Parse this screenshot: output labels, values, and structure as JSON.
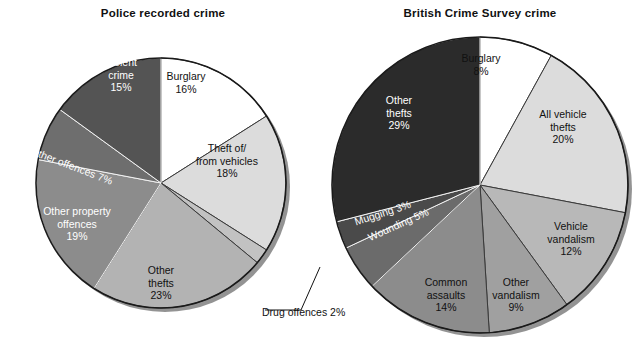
{
  "figure": {
    "background": "#ffffff",
    "left_title": "Police recorded crime",
    "right_title": "British Crime Survey crime"
  },
  "chart_data": [
    {
      "type": "pie",
      "title": "Police recorded crime",
      "xlabel": "",
      "ylabel": "",
      "units": "percent",
      "start_angle_deg": 0,
      "direction": "clockwise",
      "legend": "none (slices labelled in place)",
      "categories": [
        "Burglary",
        "Theft of/from vehicles",
        "Drug offences",
        "Other thefts",
        "Other property offences",
        "All other offences",
        "Violent crime"
      ],
      "values": [
        16,
        18,
        2,
        23,
        19,
        7,
        15
      ],
      "slices": [
        {
          "label": "Burglary",
          "label_line1": "Burglary",
          "label_line2": "16%",
          "value": 16,
          "pct": "16%",
          "color": "#ffffff",
          "text_color": "dark"
        },
        {
          "label": "Theft of/from vehicles",
          "label_line1": "Theft of/",
          "label_line2": "from vehicles",
          "label_line3": "18%",
          "value": 18,
          "pct": "18%",
          "color": "#dcdcdc",
          "text_color": "dark"
        },
        {
          "label": "Drug offences",
          "label_line1": "Drug offences 2%",
          "value": 2,
          "pct": "2%",
          "color": "#c2c2c2",
          "text_color": "dark",
          "callout": true
        },
        {
          "label": "Other thefts",
          "label_line1": "Other",
          "label_line2": "thefts",
          "label_line3": "23%",
          "value": 23,
          "pct": "23%",
          "color": "#b3b3b3",
          "text_color": "dark"
        },
        {
          "label": "Other property offences",
          "label_line1": "Other property",
          "label_line2": "offences",
          "label_line3": "19%",
          "value": 19,
          "pct": "19%",
          "color": "#8c8c8c",
          "text_color": "light"
        },
        {
          "label": "All other offences",
          "label_line1": "All other offences 7%",
          "value": 7,
          "pct": "7%",
          "color": "#6e6e6e",
          "text_color": "light"
        },
        {
          "label": "Violent crime",
          "label_line1": "Violent",
          "label_line2": "crime",
          "label_line3": "15%",
          "value": 15,
          "pct": "15%",
          "color": "#545454",
          "text_color": "light"
        }
      ]
    },
    {
      "type": "pie",
      "title": "British Crime Survey crime",
      "xlabel": "",
      "ylabel": "",
      "units": "percent",
      "start_angle_deg": 0,
      "direction": "clockwise",
      "legend": "none (slices labelled in place)",
      "categories": [
        "Burglary",
        "All vehicle thefts",
        "Vehicle vandalism",
        "Other vandalism",
        "Common assaults",
        "Wounding",
        "Mugging",
        "Other thefts"
      ],
      "values": [
        8,
        20,
        12,
        9,
        14,
        5,
        3,
        29
      ],
      "slices": [
        {
          "label": "Burglary",
          "label_line1": "Burglary",
          "label_line2": "8%",
          "value": 8,
          "pct": "8%",
          "color": "#ffffff",
          "text_color": "dark"
        },
        {
          "label": "All vehicle thefts",
          "label_line1": "All vehicle",
          "label_line2": "thefts",
          "label_line3": "20%",
          "value": 20,
          "pct": "20%",
          "color": "#dcdcdc",
          "text_color": "dark"
        },
        {
          "label": "Vehicle vandalism",
          "label_line1": "Vehicle",
          "label_line2": "vandalism",
          "label_line3": "12%",
          "value": 12,
          "pct": "12%",
          "color": "#b8b8b8",
          "text_color": "dark"
        },
        {
          "label": "Other vandalism",
          "label_line1": "Other",
          "label_line2": "vandalism",
          "label_line3": "9%",
          "value": 9,
          "pct": "9%",
          "color": "#a0a0a0",
          "text_color": "dark"
        },
        {
          "label": "Common assaults",
          "label_line1": "Common",
          "label_line2": "assaults",
          "label_line3": "14%",
          "value": 14,
          "pct": "14%",
          "color": "#8c8c8c",
          "text_color": "dark"
        },
        {
          "label": "Wounding",
          "label_line1": "Wounding 5%",
          "value": 5,
          "pct": "5%",
          "color": "#6b6b6b",
          "text_color": "light"
        },
        {
          "label": "Mugging",
          "label_line1": "Mugging 3%",
          "value": 3,
          "pct": "3%",
          "color": "#4a4a4a",
          "text_color": "light"
        },
        {
          "label": "Other thefts",
          "label_line1": "Other",
          "label_line2": "thefts",
          "label_line3": "29%",
          "value": 29,
          "pct": "29%",
          "color": "#2b2b2b",
          "text_color": "light"
        }
      ]
    }
  ]
}
